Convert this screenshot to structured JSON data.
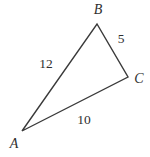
{
  "figure": {
    "type": "triangle-diagram",
    "vertices": {
      "A": "A",
      "B": "B",
      "C": "C"
    },
    "side_lengths": {
      "AB": "12",
      "BC": "5",
      "AC": "10"
    },
    "colors": {
      "background": "#ffffff",
      "stroke": "#3a3a3a",
      "text": "#2f2f2f"
    }
  }
}
